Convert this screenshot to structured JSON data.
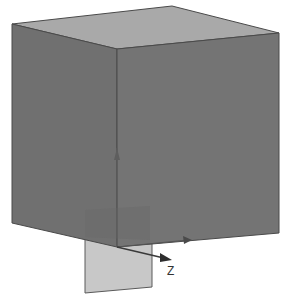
{
  "viewport": {
    "title": "3D cube with section plane",
    "background": "#ffffff"
  },
  "cube": {
    "top_color": "#a9a9a9",
    "left_color": "#6f6f6f",
    "right_color": "#737373",
    "edge_color": "#4a4a4a"
  },
  "plane": {
    "color": "#c8c8c8",
    "edge_color": "#5a5a5a"
  },
  "axes": {
    "z_label": "Z",
    "axis_color": "#3a3a3a"
  }
}
